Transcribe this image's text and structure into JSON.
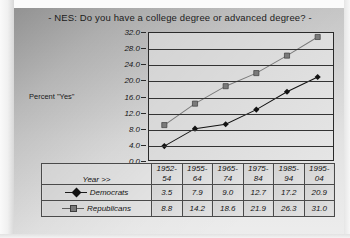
{
  "chart_data": {
    "type": "line",
    "title": "-  NES:  Do you have a college degree or advanced degree?   -",
    "xlabel": "Year >>",
    "ylabel": "Percent \"Yes\"",
    "categories": [
      "1952-54",
      "1955-64",
      "1965-74",
      "1975-84",
      "1985-94",
      "1995-04"
    ],
    "series": [
      {
        "name": "Democrats",
        "values": [
          3.5,
          7.9,
          9.0,
          12.7,
          17.2,
          20.9
        ],
        "marker": "diamond",
        "color": "#121212"
      },
      {
        "name": "Republicans",
        "values": [
          8.8,
          14.2,
          18.6,
          21.9,
          26.3,
          31.0
        ],
        "marker": "square",
        "color": "#7a7a7a"
      }
    ],
    "ylim": [
      0.0,
      32.0
    ],
    "ytick_step": 4.0,
    "yticks": [
      "32.0",
      "28.0",
      "24.0",
      "20.0",
      "16.0",
      "12.0",
      "8.0",
      "4.0",
      "0.0"
    ],
    "grid": true,
    "legend_position": "table-left-column"
  },
  "table": {
    "year_header": "Year >>",
    "year_splits": [
      {
        "top": "1952-",
        "bottom": "54"
      },
      {
        "top": "1955-",
        "bottom": "64"
      },
      {
        "top": "1965-",
        "bottom": "74"
      },
      {
        "top": "1975-",
        "bottom": "84"
      },
      {
        "top": "1985-",
        "bottom": "94"
      },
      {
        "top": "1995-",
        "bottom": "04"
      }
    ],
    "rows": [
      {
        "label": "Democrats",
        "cells": [
          "3.5",
          "7.9",
          "9.0",
          "12.7",
          "17.2",
          "20.9"
        ]
      },
      {
        "label": "Republicans",
        "cells": [
          "8.8",
          "14.2",
          "18.6",
          "21.9",
          "26.3",
          "31.0"
        ]
      }
    ]
  }
}
